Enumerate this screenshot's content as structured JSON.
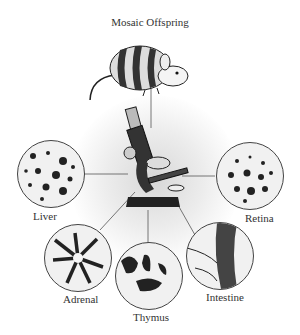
{
  "title": "Mosaic Offspring",
  "center": {
    "icon": "microscope-icon"
  },
  "subject": {
    "icon": "mouse-icon"
  },
  "tissues": [
    {
      "label": "Liver"
    },
    {
      "label": "Retina"
    },
    {
      "label": "Adrenal"
    },
    {
      "label": "Thymus"
    },
    {
      "label": "Intestine"
    }
  ],
  "colors": {
    "ink": "#222222",
    "background": "#ffffff",
    "glow": "#d8d8d8"
  }
}
